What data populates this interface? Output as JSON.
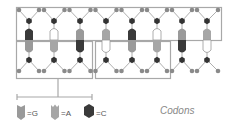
{
  "diagram": {
    "title": "Codons",
    "colors": {
      "frame": "#a8a8a8",
      "backbone_line": "#9a9a9a",
      "sugar_circle": "#8a8a8a",
      "phosphate_hex": "#333333",
      "G": "#9a9a9a",
      "A": "#a6a6a6",
      "C": "#3a3a3a",
      "T": "#ffffff"
    },
    "base_pairs": [
      {
        "top": "C",
        "bottom": "G"
      },
      {
        "top": "T",
        "bottom": "A"
      },
      {
        "top": "G",
        "bottom": "C"
      },
      {
        "top": "A",
        "bottom": "T"
      },
      {
        "top": "C",
        "bottom": "G"
      },
      {
        "top": "T",
        "bottom": "A"
      },
      {
        "top": "G",
        "bottom": "C"
      },
      {
        "top": "A",
        "bottom": "T"
      }
    ],
    "legend": [
      {
        "symbol": "G",
        "label": "=G"
      },
      {
        "symbol": "A",
        "label": "=A"
      },
      {
        "symbol": "C",
        "label": "=C"
      }
    ]
  }
}
